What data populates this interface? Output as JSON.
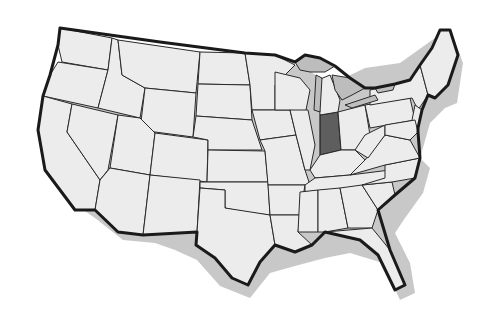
{
  "map": {
    "title": "United States map",
    "highlighted_state": "Indiana",
    "colors": {
      "background": "#ffffff",
      "state_fill": "#ececec",
      "border": "#2a2a2a",
      "great_lakes": "#bdbdbd",
      "highlight": "#5e5e5e"
    },
    "labels_visible": false
  }
}
